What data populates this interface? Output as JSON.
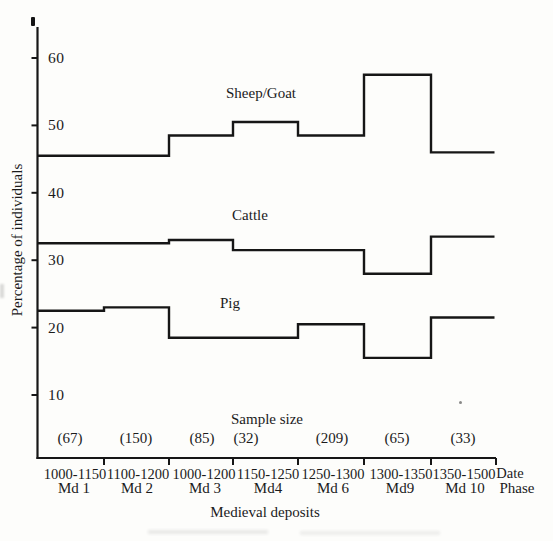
{
  "chart_data": {
    "type": "line",
    "line_style": "step-horizontal",
    "title": "",
    "ylabel": "Percentage of individuals",
    "xlabel": "Medieval deposits",
    "ylim": [
      0,
      65
    ],
    "yticks": [
      60,
      50,
      40,
      30,
      20,
      10
    ],
    "grid": false,
    "legend_position": "inline-labels-above-lines",
    "axis_right_header_date": "Date",
    "axis_right_header_phase": "Phase",
    "sample_size_header": "Sample size",
    "categories_dates": [
      "1000-1150",
      "1100-1200",
      "1000-1200",
      "1150-1250",
      "1250-1300",
      "1300-1350",
      "1350-1500"
    ],
    "categories_phases": [
      "Md 1",
      "Md 2",
      "Md 3",
      "Md4",
      "Md 6",
      "Md9",
      "Md 10"
    ],
    "sample_sizes": [
      "(67)",
      "(150)",
      "(85)",
      "(32)",
      "(209)",
      "(65)",
      "(33)"
    ],
    "series": [
      {
        "name": "Sheep/Goat",
        "values": [
          45.5,
          45.5,
          48.5,
          50.5,
          48.5,
          57.5,
          46
        ]
      },
      {
        "name": "Cattle",
        "values": [
          32.5,
          32.5,
          33,
          31.5,
          31.5,
          28,
          33.5
        ]
      },
      {
        "name": "Pig",
        "values": [
          22.5,
          23,
          18.5,
          18.5,
          20.5,
          15.5,
          21.5
        ]
      }
    ]
  },
  "colors": {
    "line": "#161616",
    "text": "#1b1b1b",
    "background": "#fdfdfb"
  }
}
